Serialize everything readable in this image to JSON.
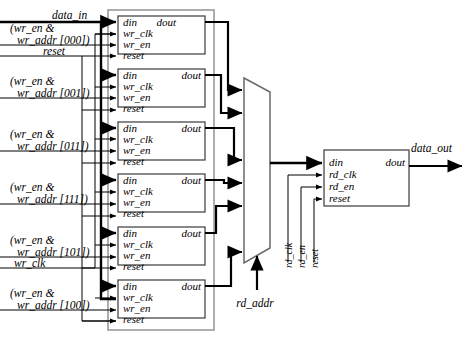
{
  "diagram": {
    "colors": {
      "wire": "#000000",
      "bus": "#000000",
      "box_stroke": "#3a3a3a",
      "container_stroke": "#9a9a9a",
      "background": "#ffffff"
    },
    "inputs": [
      {
        "name": "data-in-label",
        "text": "data_in"
      },
      {
        "name": "wr-sel-000-line1",
        "text": "(wr_en &"
      },
      {
        "name": "wr-sel-000-line2",
        "text": "wr_addr [000])"
      },
      {
        "name": "reset-label",
        "text": "reset"
      },
      {
        "name": "wr-sel-001-line1",
        "text": "(wr_en &"
      },
      {
        "name": "wr-sel-001-line2",
        "text": "wr_addr [001])"
      },
      {
        "name": "wr-sel-011-line1",
        "text": "(wr_en &"
      },
      {
        "name": "wr-sel-011-line2",
        "text": "wr_addr [011])"
      },
      {
        "name": "wr-sel-111-line1",
        "text": "(wr_en &"
      },
      {
        "name": "wr-sel-111-line2",
        "text": "wr_addr [111])"
      },
      {
        "name": "wr-sel-101-line1",
        "text": "(wr_en &"
      },
      {
        "name": "wr-sel-101-line2",
        "text": "wr_addr [101])"
      },
      {
        "name": "wr-clk-label",
        "text": "wr_clk"
      },
      {
        "name": "wr-sel-100-line1",
        "text": "(wr_en &"
      },
      {
        "name": "wr-sel-100-line2",
        "text": "wr_addr [100])"
      }
    ],
    "registers": [
      {
        "id": "reg0",
        "addr": "000",
        "pins": [
          "din",
          "wr_clk",
          "wr_en",
          "reset"
        ],
        "out": "dout"
      },
      {
        "id": "reg1",
        "addr": "001",
        "pins": [
          "din",
          "wr_clk",
          "wr_en",
          "reset"
        ],
        "out": "dout"
      },
      {
        "id": "reg2",
        "addr": "011",
        "pins": [
          "din",
          "wr_clk",
          "wr_en",
          "reset"
        ],
        "out": "dout"
      },
      {
        "id": "reg3",
        "addr": "111",
        "pins": [
          "din",
          "wr_clk",
          "wr_en",
          "reset"
        ],
        "out": "dout"
      },
      {
        "id": "reg4",
        "addr": "101",
        "pins": [
          "din",
          "wr_clk",
          "wr_en",
          "reset"
        ],
        "out": "dout"
      },
      {
        "id": "reg5",
        "addr": "100",
        "pins": [
          "din",
          "wr_clk",
          "wr_en",
          "reset"
        ],
        "out": "dout"
      }
    ],
    "mux": {
      "name": "read-multiplexer",
      "input_count": 6,
      "select_label": "rd_addr"
    },
    "output_register": {
      "name": "output-register",
      "pins": [
        "din",
        "rd_clk",
        "rd_en",
        "reset"
      ],
      "out": "dout",
      "vertical_labels": [
        "rd_clk",
        "rd_en",
        "reset"
      ]
    },
    "output": {
      "name": "data-out-label",
      "text": "data_out"
    }
  }
}
